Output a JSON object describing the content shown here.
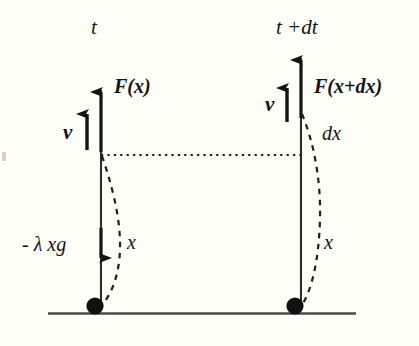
{
  "figure": {
    "background_color": "#fffffa",
    "ink_color": "#141414",
    "ground_color": "#4a4a48"
  },
  "panels": [
    {
      "id": "left",
      "time_label": "t",
      "force_label": "F(x)",
      "velocity_label": "v",
      "weight_label": "- λ xg",
      "length_label": "x"
    },
    {
      "id": "right",
      "time_label": "t +dt",
      "force_label": "F(x+dx)",
      "velocity_label": "v",
      "delta_label": "dx",
      "length_label": "x"
    }
  ],
  "elements": {
    "ground_line": "ground",
    "dotted_reference_line": "reference-level",
    "left_ball": "chain-pile-left",
    "right_ball": "chain-pile-right",
    "left_chain_curve": "chain-curve-left",
    "right_chain_curve": "chain-curve-right"
  }
}
